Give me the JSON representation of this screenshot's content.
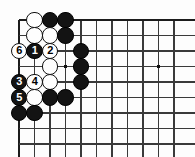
{
  "diagram": {
    "kind": "go-board-diagram",
    "board": {
      "origin_x": 19,
      "origin_y": 20,
      "spacing": 15.5,
      "cols_visible": 11,
      "rows_visible": 9,
      "edge_top": true,
      "edge_left": true,
      "line_color": "#3a3a3a",
      "edge_line_color": "#1c1c1c",
      "background_color": "#fdfdfd"
    },
    "star_points": [
      {
        "name": "star-point-left",
        "col": 3,
        "row": 3
      },
      {
        "name": "star-point-right",
        "col": 9,
        "row": 3
      }
    ],
    "colors": {
      "black_stone": "#131313",
      "white_stone": "#fefefe",
      "black_label": "#ffffff",
      "white_label": "#000000"
    },
    "stones": [
      {
        "id": "w-c1r0",
        "color": "white",
        "col": 1,
        "row": 0,
        "label": ""
      },
      {
        "id": "b-c2r0",
        "color": "black",
        "col": 2,
        "row": 0,
        "label": ""
      },
      {
        "id": "b-c3r0",
        "color": "black",
        "col": 3,
        "row": 0,
        "label": ""
      },
      {
        "id": "w-c1r1",
        "color": "white",
        "col": 1,
        "row": 1,
        "label": ""
      },
      {
        "id": "w-c2r1",
        "color": "white",
        "col": 2,
        "row": 1,
        "label": ""
      },
      {
        "id": "b-c3r1",
        "color": "black",
        "col": 3,
        "row": 1,
        "label": ""
      },
      {
        "id": "w-c0r2",
        "color": "white",
        "col": 0,
        "row": 2,
        "label": "6"
      },
      {
        "id": "b-c1r2",
        "color": "black",
        "col": 1,
        "row": 2,
        "label": "1"
      },
      {
        "id": "w-c2r2",
        "color": "white",
        "col": 2,
        "row": 2,
        "label": "2"
      },
      {
        "id": "b-c4r2",
        "color": "black",
        "col": 4,
        "row": 2,
        "label": ""
      },
      {
        "id": "w-c2r3",
        "color": "white",
        "col": 2,
        "row": 3,
        "label": ""
      },
      {
        "id": "b-c4r3",
        "color": "black",
        "col": 4,
        "row": 3,
        "label": ""
      },
      {
        "id": "b-c0r4",
        "color": "black",
        "col": 0,
        "row": 4,
        "label": "3"
      },
      {
        "id": "w-c1r4",
        "color": "white",
        "col": 1,
        "row": 4,
        "label": "4"
      },
      {
        "id": "w-c2r4",
        "color": "white",
        "col": 2,
        "row": 4,
        "label": ""
      },
      {
        "id": "b-c4r4",
        "color": "black",
        "col": 4,
        "row": 4,
        "label": ""
      },
      {
        "id": "b-c0r5",
        "color": "black",
        "col": 0,
        "row": 5,
        "label": "5"
      },
      {
        "id": "w-c1r5",
        "color": "white",
        "col": 1,
        "row": 5,
        "label": ""
      },
      {
        "id": "b-c2r5",
        "color": "black",
        "col": 2,
        "row": 5,
        "label": ""
      },
      {
        "id": "b-c3r5",
        "color": "black",
        "col": 3,
        "row": 5,
        "label": ""
      },
      {
        "id": "b-c0r6",
        "color": "black",
        "col": 0,
        "row": 6,
        "label": ""
      },
      {
        "id": "b-c1r6",
        "color": "black",
        "col": 1,
        "row": 6,
        "label": ""
      }
    ],
    "move_sequence": [
      {
        "number": "1",
        "color": "black"
      },
      {
        "number": "2",
        "color": "white"
      },
      {
        "number": "3",
        "color": "black"
      },
      {
        "number": "4",
        "color": "white"
      },
      {
        "number": "5",
        "color": "black"
      },
      {
        "number": "6",
        "color": "white"
      }
    ]
  }
}
